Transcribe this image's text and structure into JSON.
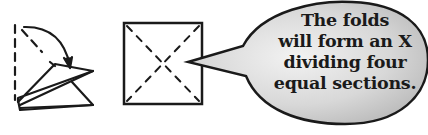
{
  "diagram": {
    "step_fold": {
      "description": "Triangle being folded with dashed fold line and curved arrow"
    },
    "step_square": {
      "description": "Square with dashed diagonal creases forming an X"
    },
    "speech_bubble": {
      "lines": [
        "The folds",
        "will form an X",
        "dividing four",
        "equal sections."
      ],
      "fill_color": "#d4d4d4",
      "stroke_color": "#1a1a1a"
    }
  }
}
